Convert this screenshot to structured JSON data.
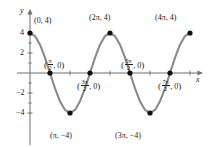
{
  "chart_data": {
    "type": "line",
    "title": "",
    "xlabel": "x",
    "ylabel": "y",
    "function": "y = 4 cos(x)",
    "xlim": [
      -0.6,
      13.6
    ],
    "ylim": [
      -5.6,
      5.6
    ],
    "grid": false,
    "legend": null,
    "x_tick_labels": [],
    "y_tick_labels": [
      "4",
      "2",
      "-2",
      "-4"
    ],
    "y_ticks": [
      4,
      2,
      -2,
      -4
    ],
    "x_ticks_unlabeled": [
      1.5708,
      3.1416,
      4.7124,
      6.2832,
      7.854,
      9.4248,
      10.9956,
      12.5664
    ],
    "series": [
      {
        "name": "y = 4 cos(x)",
        "color": "#8a8a8a",
        "x": [
          0,
          0.3927,
          0.7854,
          1.1781,
          1.5708,
          1.9635,
          2.3562,
          2.7489,
          3.1416,
          3.5343,
          3.927,
          4.3197,
          4.7124,
          5.1051,
          5.4978,
          5.8905,
          6.2832,
          6.6759,
          7.0686,
          7.4613,
          7.854,
          8.2467,
          8.6394,
          9.0321,
          9.4248,
          9.8175,
          10.2102,
          10.6029,
          10.9956,
          11.3883,
          11.781,
          12.1737,
          12.5664
        ],
        "y": [
          4,
          3.6955,
          2.8284,
          1.5307,
          0,
          -1.5307,
          -2.8284,
          -3.6955,
          -4,
          -3.6955,
          -2.8284,
          -1.5307,
          0,
          1.5307,
          2.8284,
          3.6955,
          4,
          3.6955,
          2.8284,
          1.5307,
          0,
          -1.5307,
          -2.8284,
          -3.6955,
          -4,
          -3.6955,
          -2.8284,
          -1.5307,
          0,
          1.5307,
          2.8284,
          3.6955,
          4
        ]
      }
    ],
    "marked_points": [
      {
        "id": "p0",
        "x": 0,
        "y": 4,
        "label_text": "(0, 4)",
        "kind": "maximum"
      },
      {
        "id": "p1",
        "x": 1.5708,
        "y": 0,
        "label_text": "(π/2, 0)",
        "kind": "zero"
      },
      {
        "id": "p2",
        "x": 3.1416,
        "y": -4,
        "label_text": "(π, −4)",
        "kind": "minimum"
      },
      {
        "id": "p3",
        "x": 4.7124,
        "y": 0,
        "label_text": "(3π/2, 0)",
        "kind": "zero"
      },
      {
        "id": "p4",
        "x": 6.2832,
        "y": 4,
        "label_text": "(2π, 4)",
        "kind": "maximum"
      },
      {
        "id": "p5",
        "x": 7.854,
        "y": 0,
        "label_text": "(5π/2, 0)",
        "kind": "zero"
      },
      {
        "id": "p6",
        "x": 9.4248,
        "y": -4,
        "label_text": "(3π, −4)",
        "kind": "minimum"
      },
      {
        "id": "p7",
        "x": 10.9956,
        "y": 0,
        "label_text": "(7π/2, 0)",
        "kind": "zero"
      },
      {
        "id": "p8",
        "x": 12.5664,
        "y": 4,
        "label_text": "(4π, 4)",
        "kind": "maximum"
      }
    ]
  },
  "axes": {
    "y_axis_name": "y",
    "x_axis_name": "x"
  },
  "ticks": {
    "y4": "4",
    "y2": "2",
    "ym2": "−2",
    "ym4": "−4"
  },
  "labels": {
    "p0": {
      "open": "(",
      "text": "0, 4",
      "close": ")"
    },
    "p4": {
      "open": "(",
      "pre": "2π",
      "text": ", 4",
      "close": ")"
    },
    "p8": {
      "open": "(",
      "pre": "4π",
      "text": ", 4",
      "close": ")"
    },
    "p2": {
      "open": "(",
      "pre": "π",
      "text": ", −4",
      "close": ")"
    },
    "p6": {
      "open": "(",
      "pre": "3π",
      "text": ", −4",
      "close": ")"
    },
    "p1": {
      "open": "(",
      "num": "π",
      "den": "2",
      "text": ", 0",
      "close": ")"
    },
    "p3": {
      "open": "(",
      "num": "3π",
      "den": "2",
      "text": ", 0",
      "close": ")"
    },
    "p5": {
      "open": "(",
      "num": "5π",
      "den": "2",
      "text": ", 0",
      "close": ")"
    },
    "p7": {
      "open": "(",
      "num": "7π",
      "den": "2",
      "text": ", 0",
      "close": ")"
    }
  },
  "colors": {
    "curve": "#8a8a8a",
    "axis": "#6f6f6f",
    "point": "#111111",
    "text": "#1a1a1a",
    "background": "#ffffff"
  }
}
